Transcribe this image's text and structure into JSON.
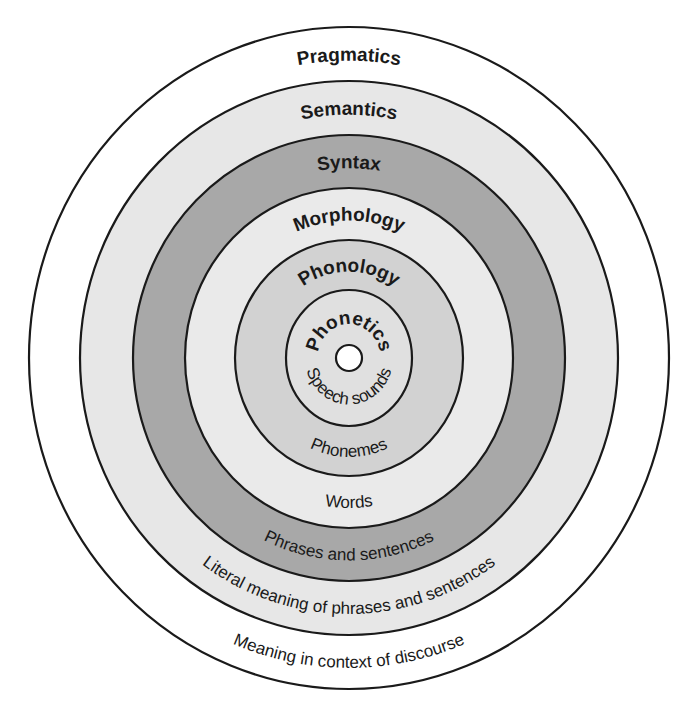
{
  "diagram": {
    "type": "concentric-circles",
    "center": {
      "x": 349,
      "y": 358
    },
    "layers": [
      {
        "id": "pragmatics",
        "title": "Pragmatics",
        "description": "Meaning in context of discourse",
        "rx": 320,
        "ry": 331,
        "fill": "#ffffff",
        "title_size": 19,
        "desc_size": 17
      },
      {
        "id": "semantics",
        "title": "Semantics",
        "description": "Literal meaning of phrases and sentences",
        "rx": 269,
        "ry": 277,
        "fill": "#e7e7e7",
        "title_size": 19,
        "desc_size": 17
      },
      {
        "id": "syntax",
        "title": "Syntax",
        "description": "Phrases and sentences",
        "rx": 216,
        "ry": 223,
        "fill": "#a8a8a8",
        "title_size": 19,
        "desc_size": 17
      },
      {
        "id": "morphology",
        "title": "Morphology",
        "description": "Words",
        "rx": 164,
        "ry": 170,
        "fill": "#eaeaea",
        "title_size": 19,
        "desc_size": 17
      },
      {
        "id": "phonology",
        "title": "Phonology",
        "description": "Phonemes",
        "rx": 114,
        "ry": 118,
        "fill": "#d2d2d2",
        "title_size": 19,
        "desc_size": 17
      },
      {
        "id": "phonetics",
        "title": "Phonetics",
        "description": "Speech sounds",
        "rx": 63,
        "ry": 68,
        "fill": "#e0e0e0",
        "title_size": 19,
        "desc_size": 17
      }
    ],
    "center_hole": {
      "r": 13,
      "fill": "#ffffff"
    }
  }
}
